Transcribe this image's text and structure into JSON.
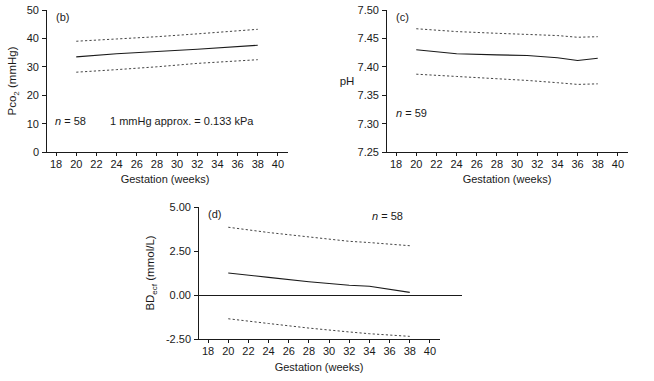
{
  "figure": {
    "title": "",
    "panel_count": 3
  },
  "chart_data": [
    {
      "type": "line",
      "panel": "(b)",
      "title": "",
      "xlabel": "Gestation (weeks)",
      "ylabel": "Pco₂ (mmHg)",
      "ylabel_main": "Pco",
      "ylabel_sub": "2",
      "ylabel_unit": " (mmHg)",
      "xlim": [
        17,
        41
      ],
      "ylim": [
        0,
        50
      ],
      "xticks": [
        18,
        20,
        22,
        24,
        26,
        28,
        30,
        32,
        34,
        36,
        38,
        40
      ],
      "xtick_labels": [
        "18",
        "20",
        "22",
        "24",
        "26",
        "28",
        "30",
        "32",
        "34",
        "36",
        "38",
        "40"
      ],
      "yticks": [
        0,
        10,
        20,
        30,
        40,
        50
      ],
      "ytick_labels": [
        "0",
        "10",
        "20",
        "30",
        "40",
        "50"
      ],
      "grid": false,
      "legend": "none",
      "annotations": [
        {
          "text": "n = 58",
          "italic_lead": "n",
          "rest": " = 58",
          "x": 21.5,
          "y": 10
        },
        {
          "text": "1 mmHg approx. = 0.133 kPa",
          "x": 29.5,
          "y": 10
        }
      ],
      "x": [
        20,
        24,
        28,
        32,
        38
      ],
      "series": [
        {
          "name": "upper 95% limit",
          "style": "dashed",
          "values": [
            39.0,
            39.8,
            40.6,
            41.6,
            43.2
          ]
        },
        {
          "name": "mean",
          "style": "solid",
          "values": [
            33.5,
            34.6,
            35.4,
            36.2,
            37.6
          ]
        },
        {
          "name": "lower 95% limit",
          "style": "dashed",
          "values": [
            28.1,
            29.0,
            30.0,
            31.2,
            32.5
          ]
        }
      ]
    },
    {
      "type": "line",
      "panel": "(c)",
      "title": "",
      "xlabel": "Gestation (weeks)",
      "ylabel": "pH",
      "xlim": [
        17,
        41
      ],
      "ylim": [
        7.25,
        7.5
      ],
      "xticks": [
        18,
        20,
        22,
        24,
        26,
        28,
        30,
        32,
        34,
        36,
        38,
        40
      ],
      "xtick_labels": [
        "18",
        "20",
        "22",
        "24",
        "26",
        "28",
        "30",
        "32",
        "34",
        "36",
        "38",
        "40"
      ],
      "yticks": [
        7.25,
        7.3,
        7.35,
        7.4,
        7.45,
        7.5
      ],
      "ytick_labels": [
        "7.25",
        "7.30",
        "7.35",
        "7.40",
        "7.45",
        "7.50"
      ],
      "grid": false,
      "legend": "none",
      "annotations": [
        {
          "text": "n = 59",
          "italic_lead": "n",
          "rest": " = 59",
          "x": 21.5,
          "y": 7.3
        }
      ],
      "x": [
        20,
        24,
        28,
        31,
        34,
        36,
        38
      ],
      "series": [
        {
          "name": "upper 95% limit",
          "style": "dashed",
          "values": [
            7.467,
            7.462,
            7.459,
            7.457,
            7.455,
            7.452,
            7.453
          ]
        },
        {
          "name": "mean",
          "style": "solid",
          "values": [
            7.43,
            7.423,
            7.421,
            7.42,
            7.416,
            7.411,
            7.415
          ]
        },
        {
          "name": "lower 95% limit",
          "style": "dashed",
          "values": [
            7.387,
            7.383,
            7.379,
            7.376,
            7.372,
            7.369,
            7.37
          ]
        }
      ]
    },
    {
      "type": "line",
      "panel": "(d)",
      "title": "",
      "xlabel": "Gestation (weeks)",
      "ylabel": "BDₑᴄᶠ (mmol/L)",
      "ylabel_main": "BD",
      "ylabel_sub": "ecf",
      "ylabel_unit": " (mmol/L)",
      "xlim": [
        17,
        41
      ],
      "ylim": [
        -2.5,
        5.0
      ],
      "xticks": [
        18,
        20,
        22,
        24,
        26,
        28,
        30,
        32,
        34,
        36,
        38,
        40
      ],
      "xtick_labels": [
        "18",
        "20",
        "22",
        "24",
        "26",
        "28",
        "30",
        "32",
        "34",
        "36",
        "38",
        "40"
      ],
      "yticks": [
        -2.5,
        0.0,
        2.5,
        5.0
      ],
      "ytick_labels": [
        "-2.50",
        "0.00",
        "2.50",
        "5.00"
      ],
      "grid": false,
      "zero_reference_line": true,
      "legend": "none",
      "annotations": [
        {
          "text": "n = 58",
          "italic_lead": "n",
          "rest": " = 58",
          "x": 34.5,
          "y": 4.55
        }
      ],
      "x": [
        20,
        24,
        28,
        32,
        34,
        38
      ],
      "series": [
        {
          "name": "upper 95% limit",
          "style": "dashed",
          "values": [
            3.85,
            3.55,
            3.3,
            3.05,
            2.98,
            2.8
          ]
        },
        {
          "name": "mean",
          "style": "solid",
          "values": [
            1.25,
            1.0,
            0.75,
            0.55,
            0.5,
            0.15
          ]
        },
        {
          "name": "lower 95% limit",
          "style": "dashed",
          "values": [
            -1.35,
            -1.62,
            -1.88,
            -2.1,
            -2.2,
            -2.35
          ]
        }
      ]
    }
  ]
}
